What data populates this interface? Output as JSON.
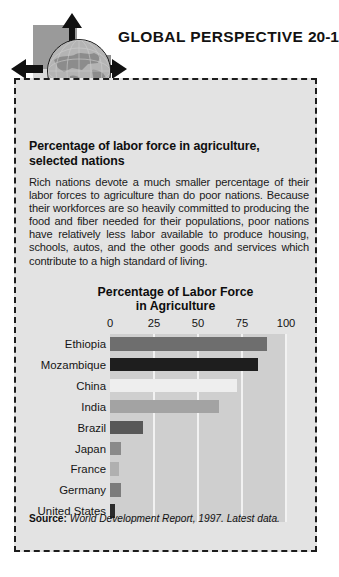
{
  "header": {
    "title": "GLOBAL PERSPECTIVE",
    "number": "20-1",
    "logo_icon": "globe-icon",
    "arrow_icons": [
      "arrow-up-icon",
      "arrow-left-icon",
      "arrow-right-icon",
      "arrow-down-icon"
    ]
  },
  "box": {
    "title": "Percentage of labor force in agriculture, selected nations",
    "body": "Rich nations devote a much smaller percentage of their labor forces to agriculture than do poor nations. Because their workforces are so heavily committed to producing the food and fiber needed for their populations, poor nations have relatively less labor available to produce housing, schools, autos, and the other goods and services which contribute to a high standard of living.",
    "source_lead": "Source:",
    "source_text": "World Development Report, 1997. Latest data."
  },
  "chart_data": {
    "type": "bar",
    "orientation": "horizontal",
    "title": "Percentage of Labor Force in Agriculture",
    "title_line1": "Percentage of Labor Force",
    "title_line2": "in Agriculture",
    "xlabel": "",
    "ylabel": "",
    "xlim": [
      0,
      100
    ],
    "ticks": [
      0,
      25,
      50,
      75,
      100
    ],
    "tick_labels": [
      "0",
      "25",
      "50",
      "75",
      "100"
    ],
    "grid": true,
    "legend": "none",
    "categories": [
      "Ethiopia",
      "Mozambique",
      "China",
      "India",
      "Brazil",
      "Japan",
      "France",
      "Germany",
      "United States"
    ],
    "values": [
      89,
      84,
      72,
      62,
      19,
      6,
      5,
      6,
      3
    ],
    "bar_colors": [
      "#6e6e6e",
      "#1e1e1e",
      "#eeeeee",
      "#a3a3a3",
      "#585858",
      "#8a8a8a",
      "#b0b0b0",
      "#7c7c7c",
      "#2b2b2b"
    ]
  },
  "colors": {
    "panel_bg": "#e3e3e3",
    "plot_bg": "#cfcfcf",
    "gridline": "#f2f2f2",
    "border": "#1c1c1c",
    "text": "#141414"
  }
}
